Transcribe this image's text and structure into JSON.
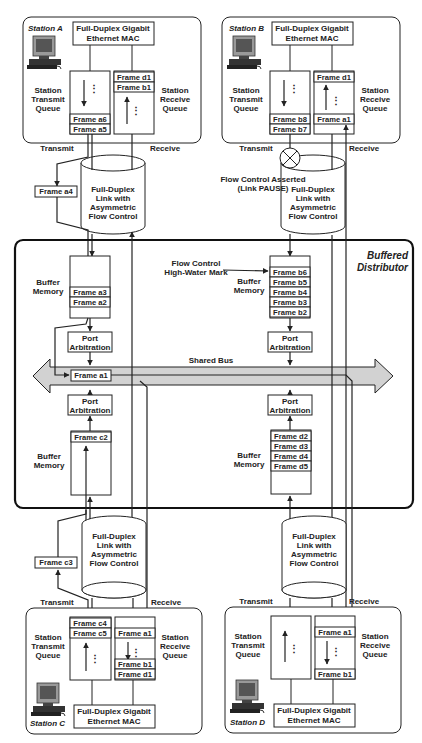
{
  "distributor_label": [
    "Buffered",
    "Distributor"
  ],
  "shared_bus_label": "Shared Bus",
  "link_label": [
    "Full-Duplex",
    "Link with",
    "Asymmetric",
    "Flow Control"
  ],
  "mac_label": [
    "Full-Duplex Gigabit",
    "Ethernet MAC"
  ],
  "transmit_queue_label": [
    "Station",
    "Transmit",
    "Queue"
  ],
  "receive_queue_label": [
    "Station",
    "Receive",
    "Queue"
  ],
  "buffer_memory_label": [
    "Buffer",
    "Memory"
  ],
  "port_arbitration_label": [
    "Port",
    "Arbitration"
  ],
  "transmit_label": "Transmit",
  "receive_label": "Receive",
  "flow_control_asserted": [
    "Flow Control Asserted",
    "(Link PAUSE)"
  ],
  "high_water_mark": [
    "Flow Control",
    "High-Water Mark"
  ],
  "bus_frame": "Frame a1",
  "stations": {
    "A": {
      "name": "Station A",
      "transmit_frames": [
        "Frame a6",
        "Frame a5"
      ],
      "receive_frames": [
        "Frame d1",
        "Frame b1"
      ],
      "in_flight": "Frame a4",
      "buffer_frames": [
        "Frame a3",
        "Frame a2"
      ]
    },
    "B": {
      "name": "Station B",
      "transmit_frames": [
        "Frame b8",
        "Frame b7"
      ],
      "receive_frames": [
        "Frame d1",
        "Frame a1"
      ],
      "buffer_frames": [
        "Frame b6",
        "Frame b5",
        "Frame b4",
        "Frame b3",
        "Frame b2"
      ]
    },
    "C": {
      "name": "Station C",
      "transmit_frames": [
        "Frame c4",
        "Frame c5"
      ],
      "receive_frames": [
        "Frame a1",
        "Frame b1",
        "Frame d1"
      ],
      "in_flight": "Frame c3",
      "buffer_frames": [
        "Frame c2"
      ]
    },
    "D": {
      "name": "Station D",
      "receive_frames": [
        "Frame a1",
        "Frame b1"
      ],
      "buffer_frames": [
        "Frame d2",
        "Frame d3",
        "Frame d4",
        "Frame d5"
      ]
    }
  }
}
